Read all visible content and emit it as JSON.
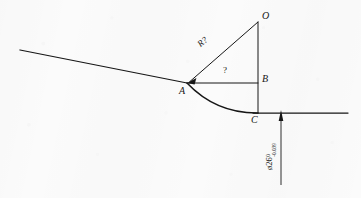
{
  "drawing": {
    "type": "engineering-geometry-diagram",
    "description": "Tangent line meeting an arc at point A, with center O, point B, and tangency point C on a horizontal line; unknown radius and unknown angle, with a diameter dimension below.",
    "width": 361,
    "height": 198,
    "background_color": "#fbfbfb",
    "line_color": "#161616",
    "points": [
      {
        "id": "O",
        "label": "O",
        "x": 258,
        "y": 22,
        "label_x": 262,
        "label_y": 12,
        "role": "arc-center"
      },
      {
        "id": "A",
        "label": "A",
        "x": 187,
        "y": 83,
        "label_x": 180,
        "label_y": 87,
        "role": "tangent-point"
      },
      {
        "id": "B",
        "label": "B",
        "x": 258,
        "y": 83,
        "label_x": 262,
        "label_y": 74,
        "role": "corner-point"
      },
      {
        "id": "C",
        "label": "C",
        "x": 258,
        "y": 113,
        "label_x": 252,
        "label_y": 116,
        "role": "tangency-point"
      }
    ],
    "labels": {
      "radius": "R?",
      "angle": "?",
      "diameter_value": "ø26",
      "tolerance_upper": "0",
      "tolerance_lower": "-0.039"
    },
    "edges": [
      {
        "id": "left-tangent-line",
        "from": [
          20,
          50
        ],
        "to": [
          187,
          83
        ]
      },
      {
        "id": "chord-line-ab",
        "from": [
          187,
          83
        ],
        "to": [
          258,
          83
        ]
      },
      {
        "id": "radius-line-oa",
        "from": [
          258,
          22
        ],
        "to": [
          187,
          83
        ]
      },
      {
        "id": "vertical-line-obc",
        "from": [
          258,
          22
        ],
        "to": [
          258,
          113
        ]
      },
      {
        "id": "bottom-line-right",
        "from": [
          253,
          113
        ],
        "to": [
          348,
          113
        ]
      },
      {
        "id": "dimension-line",
        "from": [
          281,
          113
        ],
        "to": [
          281,
          185
        ]
      }
    ],
    "arc": {
      "id": "fillet-arc-ac",
      "start": [
        187,
        83
      ],
      "end": [
        258,
        113
      ],
      "control": [
        215,
        113
      ],
      "description": "Arc tangent to the left line at A and tangent to the horizontal line at C"
    },
    "arrowheads": [
      {
        "id": "radius-arrowhead-at-a",
        "at": [
          187,
          83
        ],
        "points_toward": "A",
        "from": [
          258,
          22
        ]
      },
      {
        "id": "dimension-arrowhead-up",
        "at": [
          281,
          113
        ],
        "points_toward": "up"
      }
    ]
  }
}
